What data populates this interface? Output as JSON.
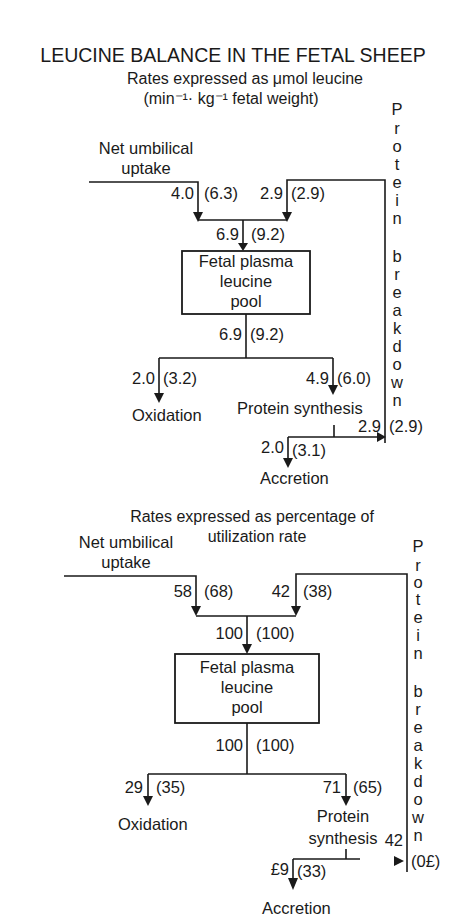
{
  "title": "LEUCINE BALANCE IN THE FETAL SHEEP",
  "panel1": {
    "caption_line1": "Rates expressed as μmol leucine",
    "caption_line2": "(min⁻¹· kg⁻¹ fetal weight)",
    "uptake_label_1": "Net umbilical",
    "uptake_label_2": "uptake",
    "uptake_value": "4.0",
    "uptake_value_alt": "(6.3)",
    "breakdown_in_value": "2.9",
    "breakdown_in_value_alt": "(2.9)",
    "pool_in_value": "6.9",
    "pool_in_value_alt": "(9.2)",
    "pool_label_1": "Fetal plasma",
    "pool_label_2": "leucine",
    "pool_label_3": "pool",
    "pool_out_value": "6.9",
    "pool_out_value_alt": "(9.2)",
    "oxidation_value": "2.0",
    "oxidation_value_alt": "(3.2)",
    "oxidation_label": "Oxidation",
    "synthesis_value": "4.9",
    "synthesis_value_alt": "(6.0)",
    "synthesis_label": "Protein synthesis",
    "breakdown_out_value": "2.9",
    "breakdown_out_value_alt": "(2.9)",
    "accretion_value": "2.0",
    "accretion_value_alt": "(3.1)",
    "accretion_label": "Accretion",
    "side_label": "Protein breakdown"
  },
  "panel2": {
    "caption_line1": "Rates expressed as percentage of",
    "caption_line2": "utilization rate",
    "uptake_label_1": "Net umbilical",
    "uptake_label_2": "uptake",
    "uptake_value": "58",
    "uptake_value_alt": "(68)",
    "breakdown_in_value": "42",
    "breakdown_in_value_alt": "(38)",
    "pool_in_value": "100",
    "pool_in_value_alt": "(100)",
    "pool_label_1": "Fetal plasma",
    "pool_label_2": "leucine",
    "pool_label_3": "pool",
    "pool_out_value": "100",
    "pool_out_value_alt": "(100)",
    "oxidation_value": "29",
    "oxidation_value_alt": "(35)",
    "oxidation_label": "Oxidation",
    "synthesis_value": "71",
    "synthesis_value_alt": "(65)",
    "synthesis_label_1": "Protein",
    "synthesis_label_2": "synthesis",
    "breakdown_out_value": "42",
    "breakdown_out_value_alt": "(0£)",
    "accretion_value": "£9",
    "accretion_value_alt": "(33)",
    "accretion_label": "Accretion",
    "side_label": "Protein breakdown"
  },
  "side_letters": [
    "P",
    "r",
    "o",
    "t",
    "e",
    "i",
    "n",
    "",
    "b",
    "r",
    "e",
    "a",
    "k",
    "d",
    "o",
    "w",
    "n"
  ]
}
